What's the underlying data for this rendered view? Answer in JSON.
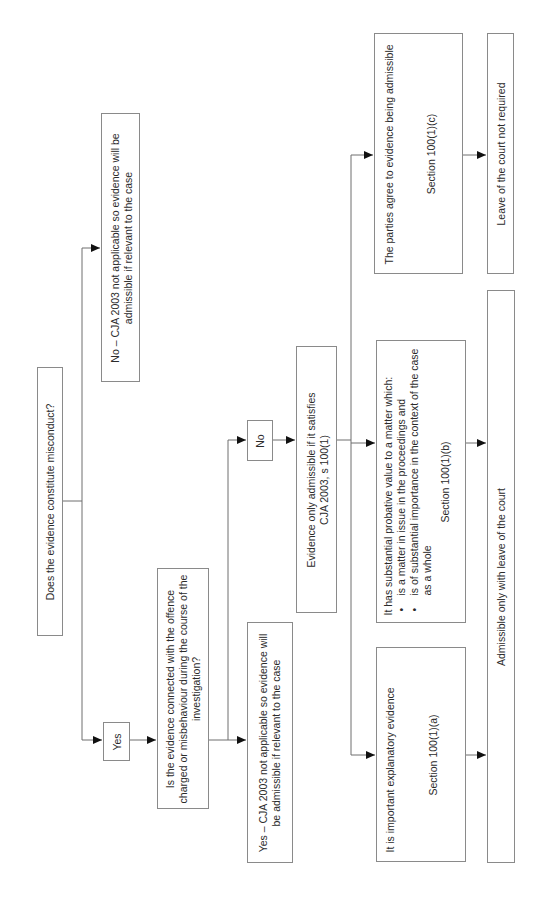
{
  "diagram": {
    "orientation": "rotated-90-counterclockwise",
    "nodes": {
      "q1": {
        "text": "Does the evidence constitute misconduct?"
      },
      "no_not_applicable": {
        "text": "No – CJA 2003 not applicable so evidence will be admissible if relevant to the case"
      },
      "yes_label": {
        "text": "Yes"
      },
      "q2": {
        "text": "Is the evidence connected with the offence charged or misbehaviour during the course of the investigation?"
      },
      "yes_not_applicable": {
        "text": "Yes – CJA 2003 not applicable so evidence will be admissible if relevant to the case"
      },
      "no_label": {
        "text": "No"
      },
      "only_admissible": {
        "text": "Evidence only admissible if it satisfies CJA 2003, s 100(1)"
      },
      "gateway_a": {
        "text": "It is important explanatory evidence",
        "section": "Section 100(1)(a)"
      },
      "gateway_b": {
        "text": "It has substantial probative value to a matter which:",
        "bullets": [
          "is a matter in issue in the proceedings and",
          "is of substantial importance in the context of the case as a whole"
        ],
        "section": "Section 100(1)(b)"
      },
      "gateway_c": {
        "text": "The parties agree to evidence being admissible",
        "section": "Section 100(1)(c)"
      },
      "leave_not_required": {
        "text": "Leave of the court not required"
      },
      "admissible_with_leave": {
        "text": "Admissible only with leave of the court"
      }
    },
    "edges": [
      {
        "from": "q1",
        "to": "no_not_applicable"
      },
      {
        "from": "q1",
        "to": "yes_label"
      },
      {
        "from": "yes_label",
        "to": "q2"
      },
      {
        "from": "q2",
        "to": "yes_not_applicable"
      },
      {
        "from": "q2",
        "to": "no_label"
      },
      {
        "from": "no_label",
        "to": "only_admissible"
      },
      {
        "from": "only_admissible",
        "to": "gateway_a"
      },
      {
        "from": "only_admissible",
        "to": "gateway_b"
      },
      {
        "from": "only_admissible",
        "to": "gateway_c"
      },
      {
        "from": "gateway_a",
        "to": "admissible_with_leave"
      },
      {
        "from": "gateway_b",
        "to": "admissible_with_leave"
      },
      {
        "from": "gateway_c",
        "to": "leave_not_required"
      }
    ],
    "colors": {
      "border": "#8a8a8a",
      "line": "#6e6e6e",
      "arrow": "#111111",
      "text": "#2b2b2b"
    }
  }
}
